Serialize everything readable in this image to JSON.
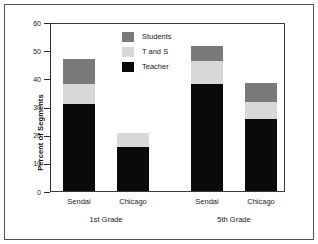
{
  "chart_data": {
    "type": "bar",
    "subtype": "stacked",
    "title": "",
    "xlabel": "",
    "ylabel": "Percent of Segments",
    "ylim": [
      0,
      60
    ],
    "yticks": [
      0,
      10,
      20,
      30,
      40,
      50,
      60
    ],
    "ytick_labels": [
      "0",
      "10",
      "20",
      "30",
      "40",
      "50",
      "60"
    ],
    "grid": false,
    "legend_position": "upper center",
    "groups": [
      {
        "label": "1st Grade",
        "categories": [
          "Sendai",
          "Chicago"
        ]
      },
      {
        "label": "5th Grade",
        "categories": [
          "Sendai",
          "Chicago"
        ]
      }
    ],
    "categories": [
      "Sendai",
      "Chicago",
      "Sendai",
      "Chicago"
    ],
    "series": [
      {
        "name": "Teacher",
        "color": "#0a0a0a",
        "values": [
          31.0,
          15.5,
          38.0,
          25.5
        ]
      },
      {
        "name": "T and S",
        "color": "#d8d8d8",
        "values": [
          7.0,
          5.0,
          8.0,
          6.0
        ]
      },
      {
        "name": "Students",
        "color": "#7a7a7a",
        "values": [
          9.0,
          0.0,
          5.5,
          7.0
        ]
      }
    ],
    "totals": [
      47.0,
      20.5,
      51.5,
      38.5
    ],
    "legend": [
      {
        "label": "Students",
        "color": "#7a7a7a"
      },
      {
        "label": "T and S",
        "color": "#d8d8d8"
      },
      {
        "label": "Teacher",
        "color": "#0a0a0a"
      }
    ]
  }
}
